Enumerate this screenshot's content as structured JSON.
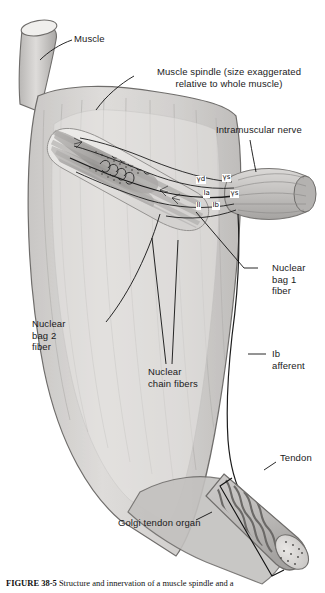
{
  "figure": {
    "caption_bold": "FIGURE 38-5",
    "caption_text": "Structure and innervation of a muscle spindle and a"
  },
  "labels": {
    "muscle": "Muscle",
    "muscle_spindle": "Muscle spindle (size exaggerated\nrelative to whole muscle)",
    "intramuscular_nerve": "Intramuscular nerve",
    "nuclear_bag_1": "Nuclear\nbag 1\nfiber",
    "nuclear_bag_2": "Nuclear\nbag 2\nfiber",
    "nuclear_chain": "Nuclear\nchain fibers",
    "ib_afferent": "Ib\nafferent",
    "tendon": "Tendon",
    "golgi_tendon_organ": "Golgi tendon organ"
  },
  "nerve_fibers": {
    "gamma_dynamic": "γd",
    "gamma_static": "γs",
    "gamma_static_2": "γs",
    "ia_afferent": "Ia",
    "group_ii": "II",
    "ib": "Ib"
  },
  "colors": {
    "muscle_body": "#d6d4d2",
    "muscle_outline": "#6f6d6b",
    "spindle_capsule": "#e8e7e5",
    "intrafusal_fiber": "#a9a7a5",
    "bag_fiber_dark": "#8e8c8a",
    "nerve_trunk": "#c9c7c5",
    "nerve_line": "#2a2a2a",
    "tendon": "#b8b6b4",
    "golgi_body": "#bdbbb9",
    "golgi_collagen": "#6b6967",
    "leader_line": "#111111",
    "text": "#1a1a1a",
    "background": "#ffffff"
  }
}
